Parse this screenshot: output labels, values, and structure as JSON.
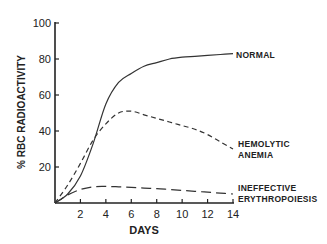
{
  "chart_data": {
    "type": "line",
    "title": "",
    "xlabel": "DAYS",
    "ylabel": "% RBC RADIOACTIVITY",
    "xlim": [
      0,
      14
    ],
    "ylim": [
      0,
      100
    ],
    "x_ticks": [
      2,
      4,
      6,
      8,
      10,
      12,
      14
    ],
    "y_ticks": [
      20,
      40,
      60,
      80,
      100
    ],
    "grid": false,
    "legend_position": "inline-right",
    "series": [
      {
        "name": "NORMAL",
        "style": "solid",
        "x": [
          0,
          1,
          2,
          3,
          4,
          5,
          6,
          7,
          8,
          9,
          10,
          11,
          12,
          13,
          14
        ],
        "values": [
          0,
          5,
          15,
          33,
          55,
          67,
          72,
          76,
          78,
          80,
          81,
          81.5,
          82,
          82.5,
          83
        ]
      },
      {
        "name": "HEMOLYTIC ANEMIA",
        "style": "short-dash",
        "x": [
          0,
          1,
          2,
          3,
          4,
          5,
          6,
          7,
          8,
          9,
          10,
          11,
          12,
          13,
          14
        ],
        "values": [
          0,
          10,
          22,
          35,
          44,
          50,
          51,
          49,
          47,
          45,
          43,
          41,
          38,
          34,
          30
        ]
      },
      {
        "name": "INEFFECTIVE ERYTHROPOIESIS",
        "style": "long-dash",
        "x": [
          0,
          1,
          2,
          3,
          4,
          5,
          6,
          7,
          8,
          9,
          10,
          11,
          12,
          13,
          14
        ],
        "values": [
          0,
          4.5,
          7.5,
          9,
          9.2,
          9,
          8.7,
          8.3,
          8,
          7.5,
          7,
          6.5,
          6,
          5.5,
          5
        ]
      }
    ]
  },
  "labels": {
    "y_axis": "% RBC RADIOACTIVITY",
    "x_axis": "DAYS",
    "normal": "NORMAL",
    "hemolytic_1": "HEMOLYTIC",
    "hemolytic_2": "ANEMIA",
    "ineffective_1": "INEFFECTIVE",
    "ineffective_2": "ERYTHROPOIESIS"
  }
}
